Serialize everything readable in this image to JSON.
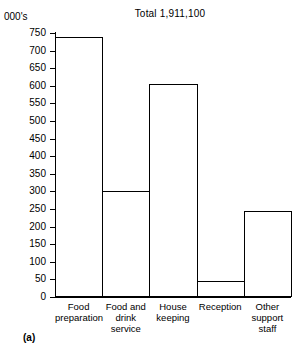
{
  "figure": {
    "caption": "(a)",
    "unit_label": "000's"
  },
  "chart_data": {
    "type": "bar",
    "title": "Total 1,911,100",
    "xlabel": "",
    "ylabel": "000's",
    "categories": [
      "Food preparation",
      "Food and drink service",
      "House keeping",
      "Reception",
      "Other support staff"
    ],
    "category_lines": [
      [
        "Food",
        "preparation"
      ],
      [
        "Food and",
        "drink",
        "service"
      ],
      [
        "House",
        "keeping"
      ],
      [
        "Reception"
      ],
      [
        "Other",
        "support",
        "staff"
      ]
    ],
    "values": [
      740,
      300,
      605,
      45,
      245
    ],
    "ylim": [
      0,
      750
    ],
    "ytick_step": 50,
    "yticks": [
      0,
      50,
      100,
      150,
      200,
      250,
      300,
      350,
      400,
      450,
      500,
      550,
      600,
      650,
      700,
      750
    ],
    "grid": false,
    "legend": "none",
    "bar_fill": "#ffffff",
    "bar_edge": "#000000",
    "bars_contiguous": true
  }
}
